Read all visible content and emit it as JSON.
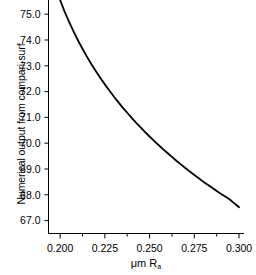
{
  "chart_data": {
    "type": "line",
    "title": "",
    "xlabel": "μm R",
    "xlabel_sub": "a",
    "ylabel": "Numerical output from compari-surf",
    "xlim": [
      0.1935,
      0.3025
    ],
    "ylim": [
      66.5,
      75.55
    ],
    "xticks": [
      0.2,
      0.225,
      0.25,
      0.275,
      0.3
    ],
    "xtick_labels": [
      "0.200",
      "0.225",
      "0.250",
      "0.275",
      "0.300"
    ],
    "xminor_ticks": [
      0.2125,
      0.2375,
      0.2625,
      0.2875
    ],
    "yticks": [
      67.0,
      68.0,
      69.0,
      70.0,
      71.0,
      72.0,
      73.0,
      74.0,
      75.0
    ],
    "ytick_labels": [
      "67.0",
      "68.0",
      "69.0",
      "70.0",
      "71.0",
      "72.0",
      "73.0",
      "74.0",
      "75.0"
    ],
    "grid": false,
    "legend": null,
    "series": [
      {
        "name": "compari-surf output",
        "color": "#000000",
        "line_width": 1.8,
        "x": [
          0.2,
          0.2025,
          0.205,
          0.2075,
          0.21,
          0.2125,
          0.215,
          0.2175,
          0.22,
          0.2225,
          0.225,
          0.2275,
          0.23,
          0.2325,
          0.235,
          0.2375,
          0.24,
          0.2425,
          0.245,
          0.2475,
          0.25,
          0.2525,
          0.255,
          0.2575,
          0.26,
          0.2625,
          0.265,
          0.2675,
          0.27,
          0.2725,
          0.275,
          0.2775,
          0.28,
          0.2825,
          0.285,
          0.2875,
          0.29,
          0.2925,
          0.295,
          0.2975,
          0.3
        ],
        "y": [
          75.55,
          75.1,
          74.7,
          74.33,
          73.98,
          73.66,
          73.35,
          73.06,
          72.79,
          72.53,
          72.28,
          72.04,
          71.81,
          71.59,
          71.38,
          71.18,
          70.98,
          70.79,
          70.61,
          70.43,
          70.26,
          70.09,
          69.93,
          69.77,
          69.62,
          69.47,
          69.32,
          69.18,
          69.04,
          68.9,
          68.77,
          68.64,
          68.51,
          68.39,
          68.27,
          68.15,
          68.03,
          67.92,
          67.81,
          67.66,
          67.52
        ]
      }
    ]
  },
  "axes": {
    "spine_color": "#000000",
    "background": "#ffffff"
  }
}
